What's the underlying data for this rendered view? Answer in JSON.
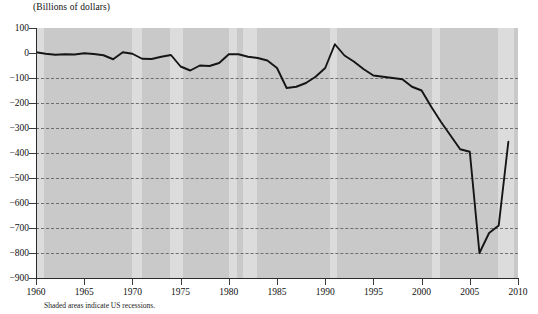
{
  "chart_data": {
    "type": "line",
    "title": "(Billions of dollars)",
    "subtitle": "",
    "xlabel": "",
    "ylabel": "",
    "footnote": "Shaded areas indicate US recessions.",
    "xlim": [
      1960,
      2010
    ],
    "ylim": [
      -900,
      100
    ],
    "grid": true,
    "legend_position": "none",
    "xticks": [
      "1960",
      "1965",
      "1970",
      "1975",
      "1980",
      "1985",
      "1990",
      "1995",
      "2000",
      "2005",
      "2010"
    ],
    "yticks": [
      "100",
      "0",
      "−100",
      "−200",
      "−300",
      "−400",
      "−500",
      "−600",
      "−700",
      "−800",
      "−900"
    ],
    "ytick_values": [
      100,
      0,
      -100,
      -200,
      -300,
      -400,
      -500,
      -600,
      -700,
      -800,
      -900
    ],
    "series": [
      {
        "name": "US federal budget balance",
        "color": "#151515",
        "x": [
          1960,
          1961,
          1962,
          1963,
          1964,
          1965,
          1966,
          1967,
          1968,
          1969,
          1970,
          1971,
          1972,
          1973,
          1974,
          1975,
          1976,
          1977,
          1978,
          1979,
          1980,
          1981,
          1982,
          1983,
          1984,
          1985,
          1986,
          1987,
          1988,
          1989,
          1990,
          1991,
          1992,
          1993,
          1994,
          1995,
          1996,
          1997,
          1998,
          1999,
          2000,
          2001,
          2002,
          2003,
          2004,
          2005,
          2006,
          2007,
          2008,
          2009
        ],
        "values": [
          3,
          -3,
          -7,
          -5,
          -6,
          -1,
          -4,
          -9,
          -25,
          3,
          -3,
          -23,
          -24,
          -15,
          -8,
          -54,
          -70,
          -50,
          -52,
          -40,
          -5,
          -5,
          -15,
          -20,
          -30,
          -60,
          -140,
          -135,
          -120,
          -95,
          -60,
          35,
          -10,
          -35,
          -65,
          -90,
          -95,
          -100,
          -105,
          -135,
          -150,
          -215,
          -275,
          -330,
          -385,
          -395,
          -800,
          -720,
          -690,
          -355
        ]
      }
    ],
    "recessions": [
      {
        "start": 1960.0,
        "end": 1960.85
      },
      {
        "start": 1969.95,
        "end": 1970.95
      },
      {
        "start": 1973.85,
        "end": 1975.2
      },
      {
        "start": 1980.0,
        "end": 1980.9
      },
      {
        "start": 1981.5,
        "end": 1982.95
      },
      {
        "start": 1990.5,
        "end": 1991.25
      },
      {
        "start": 2001.1,
        "end": 2001.95
      },
      {
        "start": 2007.9,
        "end": 2009.6
      }
    ],
    "colors": {
      "plot_background": "#c9c9c9",
      "recession_band": "#dcdcdc",
      "line": "#151515",
      "gridline": "#6e6e6e",
      "axis": "#2a2a2a",
      "page_background": "#ffffff"
    }
  }
}
